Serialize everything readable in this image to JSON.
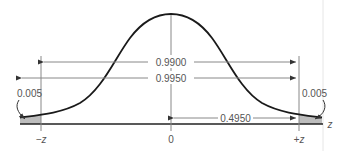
{
  "diagram": {
    "type": "normal-distribution-two-tailed",
    "colors": {
      "curve": "#1a1a1a",
      "guide": "#888888",
      "shade": "#bdbdbd",
      "axis": "#222222",
      "text": "#555555",
      "right_border": "#e6e6e6"
    },
    "labels": {
      "central_area": "0.9900",
      "left_plus_central": "0.9950",
      "half_central": "0.4950",
      "left_tail": "0.005",
      "right_tail": "0.005",
      "neg_z": "−z",
      "zero": "0",
      "pos_z": "+z",
      "axis": "z"
    }
  }
}
